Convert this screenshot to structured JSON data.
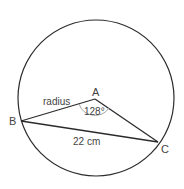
{
  "diagram": {
    "type": "circle-sector-triangle",
    "points": {
      "center": "A",
      "p1": "B",
      "p2": "C"
    },
    "labels": {
      "center": "A",
      "point_b": "B",
      "point_c": "C",
      "radius": "radius",
      "angle": "128°",
      "chord": "22 cm"
    },
    "colors": {
      "stroke": "#2b2b2b",
      "text": "#444444",
      "angle_arc": "#9a9a9a"
    }
  }
}
